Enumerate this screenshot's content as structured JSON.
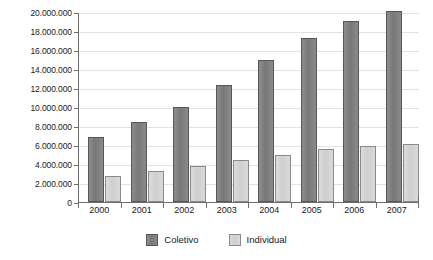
{
  "chart_data": {
    "type": "bar",
    "title": "",
    "subtitle": "",
    "xlabel": "",
    "ylabel": "",
    "categories": [
      "2000",
      "2001",
      "2002",
      "2003",
      "2004",
      "2005",
      "2006",
      "2007"
    ],
    "series": [
      {
        "name": "Coletivo",
        "color": "#808080",
        "values": [
          6800000,
          8400000,
          10000000,
          12300000,
          14900000,
          17300000,
          19100000,
          20100000
        ]
      },
      {
        "name": "Individual",
        "color": "#d4d4d4",
        "values": [
          2700000,
          3300000,
          3800000,
          4400000,
          5000000,
          5600000,
          5900000,
          6100000
        ]
      }
    ],
    "ylim": [
      0,
      20000000
    ],
    "ytick_values": [
      0,
      2000000,
      4000000,
      6000000,
      8000000,
      10000000,
      12000000,
      14000000,
      16000000,
      18000000,
      20000000
    ],
    "ytick_labels": [
      "0",
      "2.000.000",
      "4.000.000",
      "6.000.000",
      "8.000.000",
      "10.000.000",
      "12.000.000",
      "14.000.000",
      "16.000.000",
      "18.000.000",
      "20.000.000"
    ],
    "grid": true,
    "grid_color": "#e2e2e2",
    "axis_color": "#6e6e6e",
    "background": "#ffffff",
    "legend_position": "bottom",
    "legend": [
      "Coletivo",
      "Individual"
    ]
  }
}
